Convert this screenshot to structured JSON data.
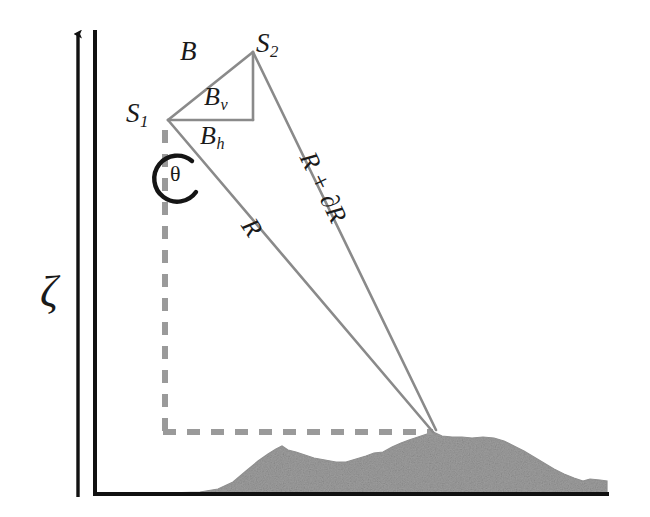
{
  "figure": {
    "kind": "insar-interferometry-geometry",
    "background_color": "#ffffff"
  },
  "axes": {
    "vertical_label": "ζ",
    "vertical_label_name": "zeta",
    "axis_color": "#111111",
    "arrow_axis": {
      "x": 78,
      "y_top": 26,
      "y_bottom": 497,
      "has_arrowhead": true
    },
    "frame": {
      "x": 95,
      "y_top": 30,
      "y_bottom": 495,
      "x_right": 607
    }
  },
  "satellites": [
    {
      "id": "S1",
      "label": "S",
      "subscript": "1",
      "x": 168,
      "y": 120
    },
    {
      "id": "S2",
      "label": "S",
      "subscript": "2",
      "x": 253,
      "y": 52
    }
  ],
  "baseline_triangle": {
    "color": "#8a8a8a",
    "vertices": {
      "s1": [
        168,
        120
      ],
      "s2": [
        253,
        52
      ],
      "corner": [
        253,
        120
      ]
    },
    "labels": {
      "hypotenuse": {
        "text": "B",
        "subscript": "",
        "meaning": "baseline"
      },
      "vertical_leg": {
        "text": "B",
        "subscript": "v",
        "meaning": "vertical baseline component"
      },
      "horizontal_leg": {
        "text": "B",
        "subscript": "h",
        "meaning": "horizontal baseline component"
      }
    }
  },
  "rays": [
    {
      "name": "range-from-s1",
      "label": "R",
      "from": [
        168,
        120
      ],
      "to": [
        433,
        432
      ],
      "color": "#8a8a8a",
      "label_rotation_deg": 57
    },
    {
      "name": "range-from-s2",
      "label": "R + ∂R",
      "from": [
        253,
        52
      ],
      "to": [
        435,
        430
      ],
      "color": "#8a8a8a",
      "label_rotation_deg": 64
    }
  ],
  "look_angle": {
    "symbol": "θ",
    "name": "theta",
    "arc_center": [
      179,
      178
    ],
    "arc_radius": 23,
    "arc_color": "#151515",
    "description": "angle between nadir (dashed vertical) and the slant range direction R"
  },
  "reference_lines": {
    "color": "#9a9a9a",
    "style": "dashed",
    "nadir_vertical": {
      "x": 165,
      "y_from": 128,
      "y_to": 432
    },
    "ground_horizontal": {
      "y": 432,
      "x_from": 163,
      "x_to": 433
    }
  },
  "target_point": {
    "x": 433,
    "y": 432,
    "on": "terrain-surface"
  },
  "terrain": {
    "name": "ground-surface-profile",
    "fill_color": "#9d9d9d",
    "baseline_y": 493,
    "x_start": 163,
    "x_end": 607,
    "profile": [
      [
        163,
        493
      ],
      [
        200,
        492
      ],
      [
        218,
        489
      ],
      [
        233,
        482
      ],
      [
        246,
        471
      ],
      [
        258,
        461
      ],
      [
        268,
        454
      ],
      [
        276,
        449
      ],
      [
        282,
        446
      ],
      [
        288,
        450
      ],
      [
        296,
        452
      ],
      [
        305,
        455
      ],
      [
        314,
        458
      ],
      [
        325,
        460
      ],
      [
        336,
        462
      ],
      [
        346,
        462
      ],
      [
        356,
        459
      ],
      [
        366,
        456
      ],
      [
        374,
        453
      ],
      [
        383,
        452
      ],
      [
        392,
        447
      ],
      [
        401,
        443
      ],
      [
        409,
        440
      ],
      [
        418,
        437
      ],
      [
        427,
        434
      ],
      [
        433,
        432
      ],
      [
        442,
        436
      ],
      [
        452,
        437
      ],
      [
        462,
        437
      ],
      [
        472,
        438
      ],
      [
        483,
        437
      ],
      [
        494,
        438
      ],
      [
        504,
        441
      ],
      [
        514,
        446
      ],
      [
        524,
        451
      ],
      [
        534,
        457
      ],
      [
        544,
        463
      ],
      [
        554,
        469
      ],
      [
        564,
        474
      ],
      [
        574,
        478
      ],
      [
        583,
        481
      ],
      [
        590,
        479
      ],
      [
        600,
        480
      ],
      [
        607,
        481
      ],
      [
        607,
        493
      ]
    ]
  },
  "colors": {
    "line_gray": "#8a8a8a",
    "dash_gray": "#9a9a9a",
    "terrain_gray": "#9d9d9d",
    "ink_black": "#151515"
  }
}
